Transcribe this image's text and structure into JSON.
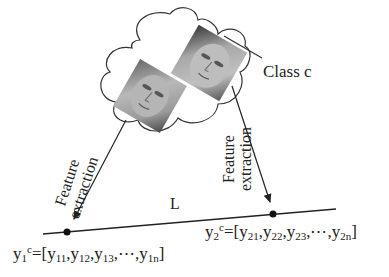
{
  "diagram": {
    "cloud_label": "Class c",
    "line_label": "L",
    "arrow_labels": [
      {
        "line1": "Feature",
        "line2": "extraction"
      },
      {
        "line1": "Feature",
        "line2": "extraction"
      }
    ],
    "vectors": [
      {
        "name": "y",
        "sub": "1",
        "sup": "c",
        "eq": "=[",
        "items": [
          {
            "b": "y",
            "s": "11"
          },
          {
            "b": "y",
            "s": "12"
          },
          {
            "b": "y",
            "s": "13"
          },
          {
            "b": "⋯",
            "s": ""
          },
          {
            "b": "y",
            "s": "1n"
          }
        ],
        "close": "]"
      },
      {
        "name": "y",
        "sub": "2",
        "sup": "c",
        "eq": "=[",
        "items": [
          {
            "b": "y",
            "s": "21"
          },
          {
            "b": "y",
            "s": "22"
          },
          {
            "b": "y",
            "s": "23"
          },
          {
            "b": "⋯",
            "s": ""
          },
          {
            "b": "y",
            "s": "2n"
          }
        ],
        "close": "]"
      }
    ],
    "icons": [
      "cloud-icon",
      "face-image-1",
      "face-image-2",
      "arrow-1",
      "arrow-2",
      "point-1",
      "point-2"
    ]
  }
}
